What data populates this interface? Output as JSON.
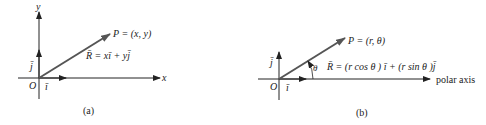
{
  "panels": [
    {
      "id": "a",
      "caption": "(a)",
      "axis_x_label": "x",
      "axis_y_label": "y",
      "origin_label": "O",
      "unit_i_label": "ī",
      "unit_j_label": "j̄",
      "point_label": "P = (x, y)",
      "vector_label": "R̄ = xī + yj̄"
    },
    {
      "id": "b",
      "caption": "(b)",
      "axis_label": "polar axis",
      "origin_label": "O",
      "unit_i_label": "ī",
      "unit_j_label": "j̄",
      "angle_label": "θ",
      "point_label": "P = (r, θ)",
      "vector_label": "R̄ = (r cos θ ) ī + (r sin θ )j̄"
    }
  ],
  "colors": {
    "axis": "#222222",
    "vector": "#555555"
  }
}
